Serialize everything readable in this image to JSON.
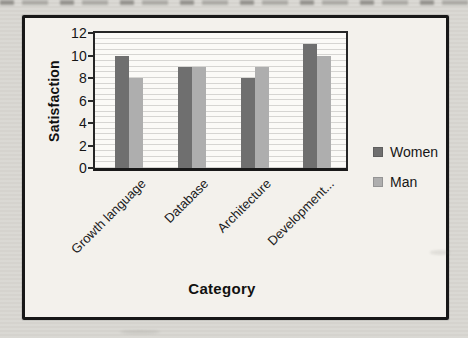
{
  "chart_data": {
    "type": "bar",
    "title": "",
    "categories": [
      "Growth language",
      "Database",
      "Architecture",
      "Development..."
    ],
    "series": [
      {
        "name": "Women",
        "color": "#6f6f6f",
        "values": [
          10,
          9,
          8,
          11
        ]
      },
      {
        "name": "Man",
        "color": "#aeaeae",
        "values": [
          8,
          9,
          9,
          10
        ]
      }
    ],
    "xlabel": "Category",
    "ylabel": "Satisfaction",
    "ylim": [
      0,
      12
    ],
    "yticks": [
      0,
      2,
      4,
      6,
      8,
      10,
      12
    ],
    "grid": "horizontal-minor",
    "legend_position": "right",
    "legend_labels": [
      "Women",
      "Man"
    ],
    "plot_border_color": "#262626",
    "frame_border_color": "#171717",
    "gridline_color": "#d6d5d2"
  }
}
